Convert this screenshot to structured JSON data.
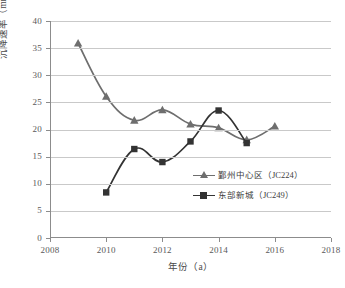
{
  "chart_data": {
    "type": "line",
    "title": "",
    "xlabel": "年份（a）",
    "ylabel": "沉降速率（mm/a）",
    "xlim": [
      2008,
      2018
    ],
    "ylim": [
      0,
      40
    ],
    "xticks": [
      "2008",
      "2010",
      "2012",
      "2014",
      "2016",
      "2018"
    ],
    "yticks": [
      "0",
      "5",
      "10",
      "15",
      "20",
      "25",
      "30",
      "35",
      "40"
    ],
    "grid": "horizontal",
    "legend_position": "inside-lower-right",
    "series": [
      {
        "name": "鄞州中心区（JC224）",
        "marker": "triangle",
        "color": "#6e6e6e",
        "x": [
          2009,
          2010,
          2011,
          2012,
          2013,
          2014,
          2015,
          2016
        ],
        "values": [
          35.9,
          26.1,
          21.7,
          23.6,
          21.0,
          20.3,
          18.1,
          20.6
        ]
      },
      {
        "name": "东部新城（JC249）",
        "marker": "square",
        "color": "#333333",
        "x": [
          2010,
          2011,
          2012,
          2013,
          2014,
          2015
        ],
        "values": [
          8.4,
          16.4,
          14.0,
          17.8,
          23.5,
          17.5
        ]
      }
    ]
  },
  "legend": {
    "items": [
      {
        "label": "鄞州中心区（JC224）"
      },
      {
        "label": "东部新城（JC249）"
      }
    ]
  },
  "axes": {
    "x_title": "年份（a）",
    "y_title": "沉降速率（mm/a）"
  }
}
